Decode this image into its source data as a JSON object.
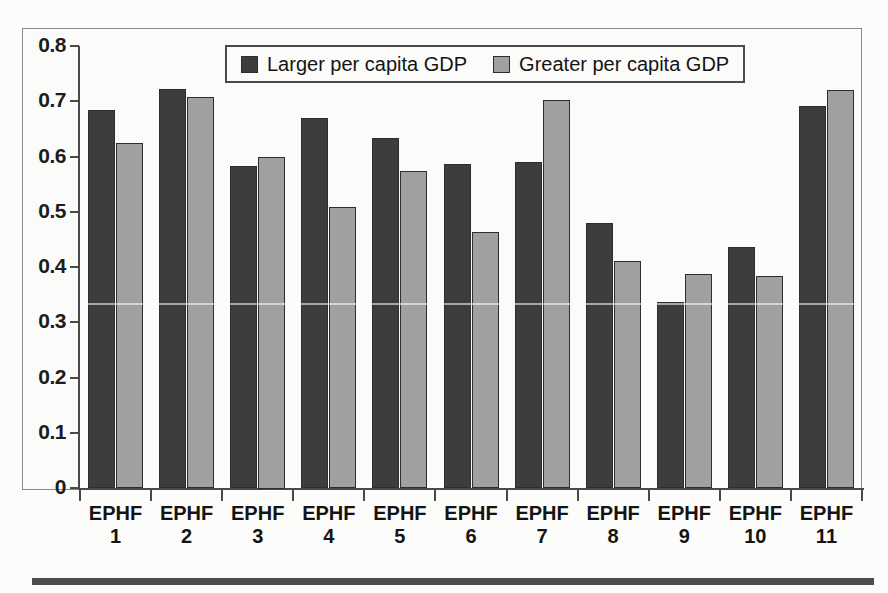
{
  "chart_data": {
    "type": "bar",
    "title": "",
    "subtitle": "",
    "xlabel": "",
    "ylabel": "",
    "categories": [
      "EPHF 1",
      "EPHF 2",
      "EPHF 3",
      "EPHF 4",
      "EPHF 5",
      "EPHF 6",
      "EPHF 7",
      "EPHF 8",
      "EPHF 9",
      "EPHF 10",
      "EPHF 11"
    ],
    "category_lines": [
      [
        "EPHF",
        "1"
      ],
      [
        "EPHF",
        "2"
      ],
      [
        "EPHF",
        "3"
      ],
      [
        "EPHF",
        "4"
      ],
      [
        "EPHF",
        "5"
      ],
      [
        "EPHF",
        "6"
      ],
      [
        "EPHF",
        "7"
      ],
      [
        "EPHF",
        "8"
      ],
      [
        "EPHF",
        "9"
      ],
      [
        "EPHF",
        "10"
      ],
      [
        "EPHF",
        "11"
      ]
    ],
    "series": [
      {
        "name": "Larger per capita GDP",
        "color": "#3d3d3d",
        "values": [
          0.685,
          0.722,
          0.583,
          0.67,
          0.633,
          0.587,
          0.59,
          0.48,
          0.336,
          0.436,
          0.692
        ]
      },
      {
        "name": "Greater per capita GDP",
        "color": "#a0a0a0",
        "values": [
          0.625,
          0.707,
          0.6,
          0.508,
          0.573,
          0.463,
          0.703,
          0.41,
          0.388,
          0.383,
          0.72
        ]
      }
    ],
    "ylim": [
      0,
      0.8
    ],
    "ytick_labels": [
      "0.8",
      "0.7",
      "0.6",
      "0.5",
      "0.4",
      "0.3",
      "0.2",
      "0.1",
      "0"
    ],
    "ytick_values": [
      0.8,
      0.7,
      0.6,
      0.5,
      0.4,
      0.3,
      0.2,
      0.1,
      0
    ],
    "grid": false,
    "legend_position": "top-center"
  },
  "legend": {
    "entries": [
      {
        "label": "Larger per capita GDP",
        "swatch": "dark-swatch-icon"
      },
      {
        "label": "Greater per capita GDP",
        "swatch": "light-swatch-icon"
      }
    ]
  }
}
